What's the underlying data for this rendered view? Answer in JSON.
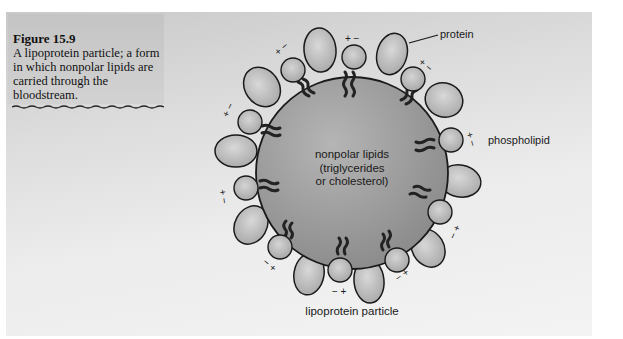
{
  "caption": {
    "figure_label": "Figure 15.9",
    "text": "A lipoprotein particle; a form in which nonpolar lipids are carried through the bloodstream."
  },
  "diagram": {
    "core_label_line1": "nonpolar lipids",
    "core_label_line2": "(triglycerides",
    "core_label_line3": "or cholesterol)",
    "protein_label": "protein",
    "phospholipid_label": "phospholipid",
    "particle_label": "lipoprotein particle",
    "charges": [
      "+",
      "−"
    ]
  },
  "colors": {
    "core": "#9a9a9a",
    "protein": "#bdbdbd",
    "outline": "#1a1a1a"
  }
}
